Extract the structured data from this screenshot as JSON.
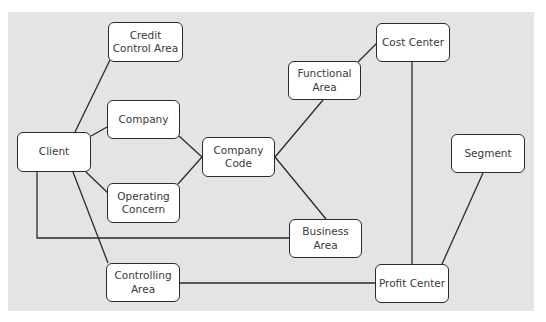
{
  "diagram": {
    "type": "organizational-structure",
    "nodes": [
      {
        "id": "client",
        "label": "Client"
      },
      {
        "id": "credit_control_area",
        "label": "Credit Control Area"
      },
      {
        "id": "company",
        "label": "Company"
      },
      {
        "id": "operating_concern",
        "label": "Operating Concern"
      },
      {
        "id": "controlling_area",
        "label": "Controlling Area"
      },
      {
        "id": "company_code",
        "label": "Company Code"
      },
      {
        "id": "functional_area",
        "label": "Functional Area"
      },
      {
        "id": "cost_center",
        "label": "Cost Center"
      },
      {
        "id": "business_area",
        "label": "Business Area"
      },
      {
        "id": "profit_center",
        "label": "Profit Center"
      },
      {
        "id": "segment",
        "label": "Segment"
      }
    ],
    "edges": [
      {
        "from": "client",
        "to": "credit_control_area"
      },
      {
        "from": "client",
        "to": "company"
      },
      {
        "from": "client",
        "to": "operating_concern"
      },
      {
        "from": "client",
        "to": "controlling_area"
      },
      {
        "from": "client",
        "to": "business_area"
      },
      {
        "from": "company",
        "to": "company_code"
      },
      {
        "from": "operating_concern",
        "to": "company_code"
      },
      {
        "from": "company_code",
        "to": "functional_area"
      },
      {
        "from": "company_code",
        "to": "business_area"
      },
      {
        "from": "functional_area",
        "to": "cost_center"
      },
      {
        "from": "cost_center",
        "to": "profit_center"
      },
      {
        "from": "controlling_area",
        "to": "profit_center"
      },
      {
        "from": "segment",
        "to": "profit_center"
      }
    ]
  }
}
